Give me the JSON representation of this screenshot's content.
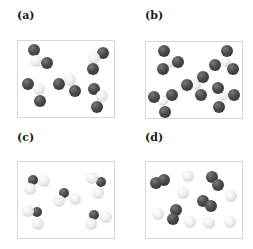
{
  "figure": {
    "panels": [
      {
        "label": "(a)",
        "label_pos": [
          17,
          10
        ],
        "box": [
          17,
          40
        ],
        "description": "bent triatomic molecules: central light atom bonded to two dark atoms",
        "atoms": [
          {
            "t": "dark",
            "x": 16,
            "y": 9,
            "r": 6
          },
          {
            "t": "light",
            "x": 18,
            "y": 20,
            "r": 6
          },
          {
            "t": "dark",
            "x": 29,
            "y": 22,
            "r": 6
          },
          {
            "t": "dark",
            "x": 85,
            "y": 12,
            "r": 6
          },
          {
            "t": "light",
            "x": 76,
            "y": 17,
            "r": 6
          },
          {
            "t": "dark",
            "x": 75,
            "y": 28,
            "r": 6
          },
          {
            "t": "dark",
            "x": 10,
            "y": 43,
            "r": 6
          },
          {
            "t": "light",
            "x": 21,
            "y": 48,
            "r": 6
          },
          {
            "t": "dark",
            "x": 22,
            "y": 60,
            "r": 6
          },
          {
            "t": "dark",
            "x": 41,
            "y": 43,
            "r": 6
          },
          {
            "t": "light",
            "x": 52,
            "y": 39,
            "r": 6
          },
          {
            "t": "dark",
            "x": 57,
            "y": 50,
            "r": 6
          },
          {
            "t": "dark",
            "x": 76,
            "y": 48,
            "r": 6
          },
          {
            "t": "light",
            "x": 84,
            "y": 55,
            "r": 6
          },
          {
            "t": "dark",
            "x": 79,
            "y": 66,
            "r": 6
          }
        ]
      },
      {
        "label": "(b)",
        "label_pos": [
          145,
          10
        ],
        "box": [
          145,
          41
        ],
        "description": "trigonal planar molecules: central light atom bonded to three dark atoms",
        "atoms": [
          {
            "t": "light",
            "x": 23,
            "y": 21,
            "r": 5
          },
          {
            "t": "dark",
            "x": 18,
            "y": 9,
            "r": 6
          },
          {
            "t": "dark",
            "x": 32,
            "y": 20,
            "r": 6
          },
          {
            "t": "dark",
            "x": 17,
            "y": 27,
            "r": 6
          },
          {
            "t": "light",
            "x": 80,
            "y": 20,
            "r": 5
          },
          {
            "t": "dark",
            "x": 81,
            "y": 9,
            "r": 6
          },
          {
            "t": "dark",
            "x": 69,
            "y": 23,
            "r": 6
          },
          {
            "t": "dark",
            "x": 87,
            "y": 27,
            "r": 6
          },
          {
            "t": "light",
            "x": 50,
            "y": 43,
            "r": 5
          },
          {
            "t": "dark",
            "x": 57,
            "y": 35,
            "r": 6
          },
          {
            "t": "dark",
            "x": 41,
            "y": 43,
            "r": 6
          },
          {
            "t": "dark",
            "x": 55,
            "y": 53,
            "r": 6
          },
          {
            "t": "light",
            "x": 17,
            "y": 59,
            "r": 5
          },
          {
            "t": "dark",
            "x": 8,
            "y": 55,
            "r": 6
          },
          {
            "t": "dark",
            "x": 26,
            "y": 53,
            "r": 6
          },
          {
            "t": "dark",
            "x": 19,
            "y": 70,
            "r": 6
          },
          {
            "t": "light",
            "x": 77,
            "y": 54,
            "r": 5
          },
          {
            "t": "dark",
            "x": 72,
            "y": 46,
            "r": 6
          },
          {
            "t": "dark",
            "x": 88,
            "y": 53,
            "r": 6
          },
          {
            "t": "dark",
            "x": 73,
            "y": 65,
            "r": 6
          }
        ]
      },
      {
        "label": "(c)",
        "label_pos": [
          17,
          132
        ],
        "box": [
          17,
          161
        ],
        "description": "bent triatomic molecules: small dark central atom bonded to two large light atoms",
        "atoms": [
          {
            "t": "dark",
            "x": 15,
            "y": 18,
            "r": 5
          },
          {
            "t": "light",
            "x": 26,
            "y": 19,
            "r": 6
          },
          {
            "t": "light",
            "x": 12,
            "y": 27,
            "r": 6
          },
          {
            "t": "dark",
            "x": 46,
            "y": 31,
            "r": 5
          },
          {
            "t": "light",
            "x": 41,
            "y": 39,
            "r": 6
          },
          {
            "t": "light",
            "x": 57,
            "y": 37,
            "r": 6
          },
          {
            "t": "dark",
            "x": 83,
            "y": 20,
            "r": 5
          },
          {
            "t": "light",
            "x": 74,
            "y": 16,
            "r": 6
          },
          {
            "t": "light",
            "x": 80,
            "y": 31,
            "r": 6
          },
          {
            "t": "dark",
            "x": 19,
            "y": 50,
            "r": 5
          },
          {
            "t": "light",
            "x": 10,
            "y": 49,
            "r": 6
          },
          {
            "t": "light",
            "x": 20,
            "y": 62,
            "r": 6
          },
          {
            "t": "dark",
            "x": 76,
            "y": 53,
            "r": 5
          },
          {
            "t": "light",
            "x": 88,
            "y": 55,
            "r": 6
          },
          {
            "t": "light",
            "x": 73,
            "y": 62,
            "r": 6
          }
        ]
      },
      {
        "label": "(d)",
        "label_pos": [
          145,
          132
        ],
        "box": [
          145,
          161
        ],
        "description": "mixture of dark diatomic molecules and separate light single atoms",
        "atoms": [
          {
            "t": "dark",
            "x": 10,
            "y": 21,
            "r": 6
          },
          {
            "t": "dark",
            "x": 18,
            "y": 18,
            "r": 6
          },
          {
            "t": "dark",
            "x": 66,
            "y": 15,
            "r": 6
          },
          {
            "t": "dark",
            "x": 72,
            "y": 23,
            "r": 6
          },
          {
            "t": "dark",
            "x": 57,
            "y": 39,
            "r": 6
          },
          {
            "t": "dark",
            "x": 65,
            "y": 44,
            "r": 6
          },
          {
            "t": "dark",
            "x": 30,
            "y": 48,
            "r": 6
          },
          {
            "t": "dark",
            "x": 27,
            "y": 57,
            "r": 6
          },
          {
            "t": "light",
            "x": 42,
            "y": 14,
            "r": 6
          },
          {
            "t": "light",
            "x": 37,
            "y": 31,
            "r": 6
          },
          {
            "t": "light",
            "x": 85,
            "y": 34,
            "r": 6
          },
          {
            "t": "light",
            "x": 12,
            "y": 52,
            "r": 6
          },
          {
            "t": "light",
            "x": 44,
            "y": 60,
            "r": 6
          },
          {
            "t": "light",
            "x": 63,
            "y": 61,
            "r": 6
          },
          {
            "t": "light",
            "x": 84,
            "y": 60,
            "r": 6
          }
        ]
      }
    ]
  },
  "colors": {
    "dark_atom": "#4a4a4a",
    "light_atom": "#efefef",
    "panel_border": "#d6d6d6",
    "label": "#1a1a1a"
  }
}
